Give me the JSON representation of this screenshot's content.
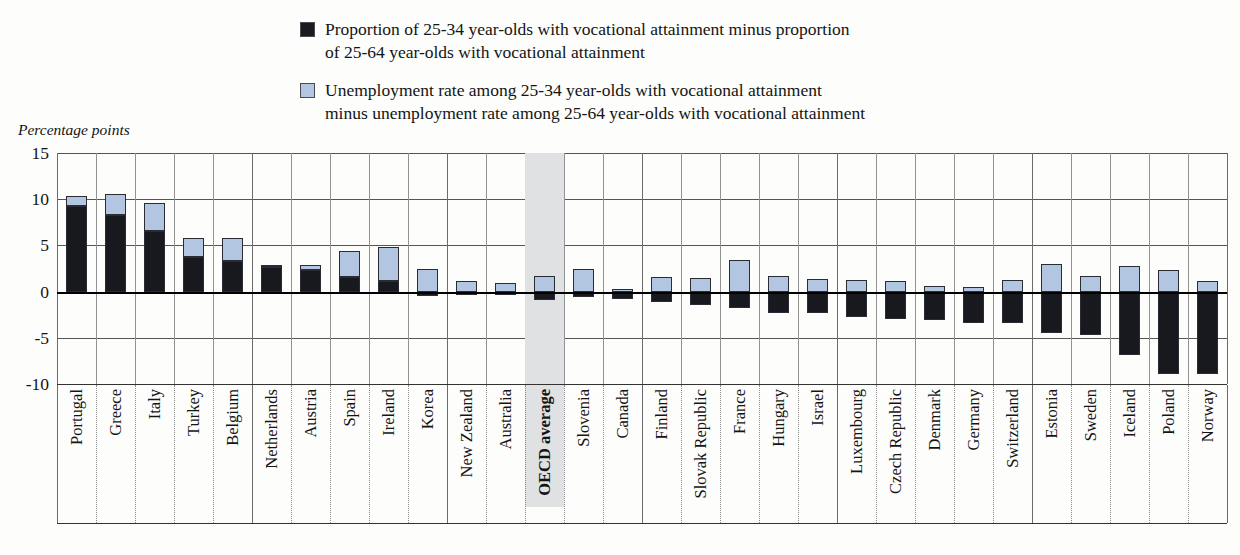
{
  "axis_title": "Percentage points",
  "legend": [
    {
      "swatch": "dark",
      "color": "#18181f",
      "line1": "Proportion of 25-34 year-olds with vocational attainment minus proportion",
      "line2": "of 25-64 year-olds with vocational attainment"
    },
    {
      "swatch": "light",
      "color": "#b2c6e2",
      "line1": "Unemployment rate among 25-34 year-olds with vocational attainment",
      "line2": "minus unemployment rate among 25-64 year-olds with vocational attainment"
    }
  ],
  "highlight_category": "OECD average",
  "chart_data": {
    "type": "bar",
    "subtype": "stacked-bar-diverging",
    "title": "",
    "xlabel": "",
    "ylabel": "Percentage points",
    "ylim": [
      -10,
      15
    ],
    "yticks": [
      15,
      10,
      5,
      0,
      -5,
      -10
    ],
    "ytick_labels": [
      "15",
      "10",
      "5",
      "0",
      "-5",
      "-10"
    ],
    "grid": true,
    "legend_position": "top",
    "categories": [
      "Portugal",
      "Greece",
      "Italy",
      "Turkey",
      "Belgium",
      "Netherlands",
      "Austria",
      "Spain",
      "Ireland",
      "Korea",
      "New Zealand",
      "Australia",
      "OECD average",
      "Slovenia",
      "Canada",
      "Finland",
      "Slovak Republic",
      "France",
      "Hungary",
      "Israel",
      "Luxembourg",
      "Czech Republic",
      "Denmark",
      "Germany",
      "Switzerland",
      "Estonia",
      "Sweden",
      "Iceland",
      "Poland",
      "Norway"
    ],
    "series": [
      {
        "name": "Proportion of 25-34 year-olds with vocational attainment minus proportion of 25-64 year-olds with vocational attainment",
        "color": "#18181f",
        "values": [
          9.3,
          8.3,
          6.6,
          3.7,
          3.3,
          2.7,
          2.3,
          1.6,
          1.1,
          -0.5,
          -0.4,
          -0.4,
          -0.9,
          -0.6,
          -0.8,
          -1.1,
          -1.4,
          -1.8,
          -2.3,
          -2.3,
          -2.7,
          -3.0,
          -3.1,
          -3.4,
          -3.4,
          -4.5,
          -4.7,
          -6.9,
          -8.9,
          -8.9
        ]
      },
      {
        "name": "Unemployment rate among 25-34 year-olds with vocational attainment minus unemployment rate among 25-64 year-olds with vocational attainment",
        "color": "#b2c6e2",
        "values": [
          1.0,
          2.3,
          3.0,
          2.1,
          2.5,
          0.2,
          0.6,
          2.8,
          3.7,
          2.5,
          1.1,
          0.9,
          1.7,
          2.4,
          0.3,
          1.6,
          1.5,
          3.4,
          1.7,
          1.4,
          1.3,
          1.1,
          0.6,
          0.5,
          1.3,
          3.0,
          1.7,
          2.8,
          2.3,
          1.1
        ]
      }
    ],
    "totals_top": [
      10.3,
      10.6,
      9.6,
      5.8,
      5.8,
      2.9,
      2.9,
      4.4,
      4.8,
      2.5,
      1.1,
      0.9,
      1.7,
      2.4,
      0.3,
      1.6,
      1.5,
      3.4,
      1.7,
      1.4,
      1.3,
      1.1,
      0.6,
      0.5,
      1.3,
      3.0,
      1.7,
      2.8,
      2.3,
      1.1
    ]
  }
}
